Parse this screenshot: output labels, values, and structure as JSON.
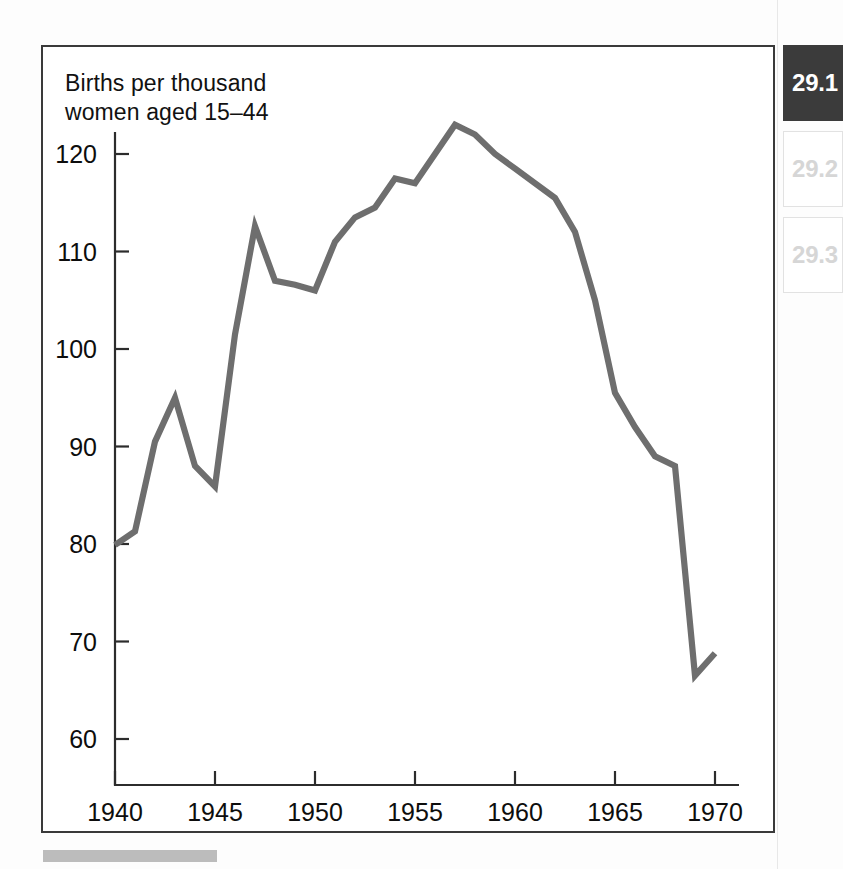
{
  "figure": {
    "axis_caption": "Births per thousand\nwomen aged 15–44",
    "caption_bar_label": "caption-placeholder"
  },
  "section_rail": {
    "items": [
      {
        "label": "29.1",
        "state": "active"
      },
      {
        "label": "29.2",
        "state": "inactive"
      },
      {
        "label": "29.3",
        "state": "inactive"
      }
    ]
  },
  "chart_data": {
    "type": "line",
    "title": "",
    "subtitle": "",
    "xlabel": "",
    "ylabel": "Births per thousand women aged 15–44",
    "xlim": [
      1939,
      1971
    ],
    "ylim": [
      57,
      126
    ],
    "xticks": [
      1940,
      1945,
      1950,
      1955,
      1960,
      1965,
      1970
    ],
    "xticklabels": [
      "1940",
      "1945",
      "1950",
      "1955",
      "1960",
      "1965",
      "1970"
    ],
    "yticks": [
      60,
      70,
      80,
      90,
      100,
      110,
      120
    ],
    "yticklabels": [
      "60",
      "70",
      "80",
      "90",
      "100",
      "110",
      "120"
    ],
    "grid": false,
    "legend": false,
    "line_color": "#6e6e6e",
    "line_width": 6.2,
    "x": [
      1940,
      1941,
      1942,
      1943,
      1944,
      1945,
      1946,
      1947,
      1948,
      1949,
      1950,
      1951,
      1952,
      1953,
      1954,
      1955,
      1956,
      1957,
      1958,
      1959,
      1960,
      1961,
      1962,
      1963,
      1964,
      1965,
      1966,
      1967,
      1968,
      1969,
      1970
    ],
    "values": [
      79.9,
      81.3,
      90.5,
      95.0,
      88.0,
      85.9,
      101.5,
      112.6,
      107.0,
      106.6,
      106.0,
      111.0,
      113.5,
      114.5,
      117.5,
      117.0,
      120.0,
      123.0,
      122.0,
      120.0,
      118.5,
      117.0,
      115.5,
      112.0,
      105.0,
      95.5,
      92.0,
      89.0,
      88.0,
      66.5,
      68.8
    ],
    "series": [
      {
        "name": "Births per thousand women aged 15–44",
        "color": "#6e6e6e",
        "values": [
          79.9,
          81.3,
          90.5,
          95.0,
          88.0,
          85.9,
          101.5,
          112.6,
          107.0,
          106.6,
          106.0,
          111.0,
          113.5,
          114.5,
          117.5,
          117.0,
          120.0,
          123.0,
          122.0,
          120.0,
          118.5,
          117.0,
          115.5,
          112.0,
          105.0,
          95.5,
          92.0,
          89.0,
          88.0,
          66.5,
          68.8
        ]
      }
    ],
    "annotations": []
  }
}
